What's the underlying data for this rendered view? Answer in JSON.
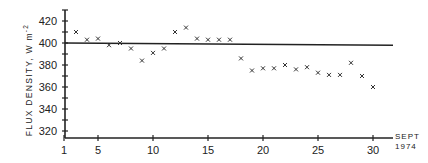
{
  "chart_data": {
    "type": "scatter",
    "title": "",
    "xlabel": "SEPT 1974",
    "xlabel_lines": [
      "SEPT",
      "1974"
    ],
    "ylabel": "FLUX DENSITY, W m-2",
    "ylabel_main": "FLUX DENSITY, W m",
    "ylabel_sup": "-2",
    "xlim": [
      1,
      31
    ],
    "ylim": [
      310,
      430
    ],
    "x_ticks": [
      1,
      5,
      10,
      15,
      20,
      25,
      30
    ],
    "y_ticks": [
      320,
      340,
      360,
      380,
      400,
      420
    ],
    "grid": false,
    "legend": null,
    "series": [
      {
        "name": "Daily flux density",
        "marker": "x",
        "x": [
          3,
          4,
          5,
          6,
          7,
          8,
          9,
          10,
          11,
          12,
          13,
          14,
          15,
          16,
          17,
          18,
          19,
          20,
          21,
          22,
          23,
          24,
          25,
          26,
          27,
          28,
          29,
          30
        ],
        "values": [
          410,
          403,
          404,
          398,
          400,
          395,
          384,
          391,
          395,
          410,
          414,
          404,
          403,
          403,
          403,
          386,
          375,
          377,
          377,
          380,
          376,
          378,
          373,
          371,
          371,
          382,
          370,
          360
        ]
      }
    ],
    "reference_line": {
      "name": "Mean level",
      "x": [
        1,
        31
      ],
      "y": [
        400,
        398
      ]
    }
  }
}
